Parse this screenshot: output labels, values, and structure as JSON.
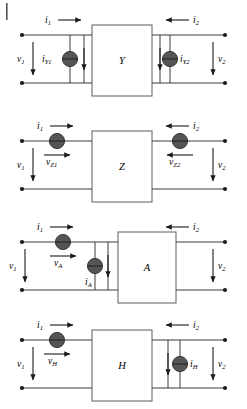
{
  "figure": {
    "page_edge_mark": "|",
    "colors": {
      "wire": "#3a3a3a",
      "box_outline": "#6a6a6a",
      "source_fill": "#555555",
      "terminal": "#1a1a1a",
      "background": "#ffffff"
    }
  },
  "diagrams": [
    {
      "id": "y-parameters",
      "box_label": "Y",
      "port1": {
        "current_label": "i",
        "current_sub": "1",
        "voltage_label": "v",
        "voltage_sub": "1",
        "current_direction": "right",
        "voltage_direction": "down"
      },
      "port2": {
        "current_label": "i",
        "current_sub": "2",
        "voltage_label": "v",
        "voltage_sub": "2",
        "current_direction": "left",
        "voltage_direction": "down"
      },
      "sources": [
        {
          "type": "current",
          "label": "i",
          "sub": "Y1",
          "position": "shunt-left",
          "arrow_direction": "down",
          "label_side": "left"
        },
        {
          "type": "current",
          "label": "i",
          "sub": "Y2",
          "position": "shunt-right",
          "arrow_direction": "down",
          "label_side": "right"
        }
      ]
    },
    {
      "id": "z-parameters",
      "box_label": "Z",
      "port1": {
        "current_label": "i",
        "current_sub": "1",
        "voltage_label": "v",
        "voltage_sub": "1",
        "current_direction": "right",
        "voltage_direction": "down"
      },
      "port2": {
        "current_label": "i",
        "current_sub": "2",
        "voltage_label": "v",
        "voltage_sub": "2",
        "current_direction": "left",
        "voltage_direction": "down"
      },
      "sources": [
        {
          "type": "voltage",
          "label": "v",
          "sub": "Z1",
          "position": "series-left",
          "arrow_direction": "right",
          "label_side": "below"
        },
        {
          "type": "voltage",
          "label": "v",
          "sub": "Z2",
          "position": "series-right",
          "arrow_direction": "left",
          "label_side": "below"
        }
      ]
    },
    {
      "id": "a-parameters",
      "box_label": "A",
      "port1": {
        "current_label": "i",
        "current_sub": "1",
        "voltage_label": "v",
        "voltage_sub": "1",
        "current_direction": "right",
        "voltage_direction": "down"
      },
      "port2": {
        "current_label": "i",
        "current_sub": "2",
        "voltage_label": "v",
        "voltage_sub": "2",
        "current_direction": "left",
        "voltage_direction": "down"
      },
      "sources": [
        {
          "type": "voltage",
          "label": "v",
          "sub": "A",
          "position": "series-left",
          "arrow_direction": "right",
          "label_side": "below"
        },
        {
          "type": "current",
          "label": "i",
          "sub": "A",
          "position": "shunt-left",
          "arrow_direction": "down",
          "label_side": "below-left"
        }
      ]
    },
    {
      "id": "h-parameters",
      "box_label": "H",
      "port1": {
        "current_label": "i",
        "current_sub": "1",
        "voltage_label": "v",
        "voltage_sub": "1",
        "current_direction": "right",
        "voltage_direction": "down"
      },
      "port2": {
        "current_label": "i",
        "current_sub": "2",
        "voltage_label": "v",
        "voltage_sub": "2",
        "current_direction": "left",
        "voltage_direction": "down"
      },
      "sources": [
        {
          "type": "voltage",
          "label": "v",
          "sub": "H",
          "position": "series-left",
          "arrow_direction": "right",
          "label_side": "below"
        },
        {
          "type": "current",
          "label": "i",
          "sub": "H",
          "position": "shunt-right",
          "arrow_direction": "down",
          "label_side": "right"
        }
      ]
    }
  ]
}
